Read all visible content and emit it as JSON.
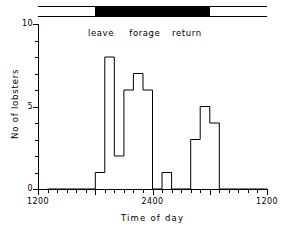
{
  "figure": {
    "background": "#ffffff",
    "ink": "#000000"
  },
  "daylight_bar": {
    "name": "light-dark-cycle-bar",
    "light_color": "#ffffff",
    "dark_color": "#000000",
    "segments": [
      {
        "label": "light",
        "start_hour": 12.0,
        "end_hour": 18.0,
        "color": "#ffffff"
      },
      {
        "label": "dark",
        "start_hour": 18.0,
        "end_hour": 30.0,
        "color": "#000000"
      },
      {
        "label": "light",
        "start_hour": 30.0,
        "end_hour": 36.0,
        "color": "#ffffff"
      }
    ]
  },
  "phase_labels": [
    {
      "text": "leave",
      "hour": 18.6
    },
    {
      "text": "forage",
      "hour": 23.2
    },
    {
      "text": "return",
      "hour": 27.6
    }
  ],
  "chart_data": {
    "type": "bar",
    "title": "",
    "subtitle": "",
    "xlabel": "Time of day",
    "ylabel": "No of lobsters",
    "xlim": [
      12,
      36
    ],
    "ylim": [
      0,
      10
    ],
    "grid": false,
    "legend": null,
    "bar_width_hours": 1,
    "x_tick_labels": [
      {
        "hour": 12,
        "label": "1200"
      },
      {
        "hour": 24,
        "label": "2400"
      },
      {
        "hour": 36,
        "label": "1200"
      }
    ],
    "x_major_ticks_hours": [
      12,
      18,
      24,
      30,
      36
    ],
    "x_minor_tick_step_hours": 1,
    "y_tick_labels": [
      {
        "value": 0,
        "label": "0"
      },
      {
        "value": 5,
        "label": "5"
      },
      {
        "value": 10,
        "label": "10"
      }
    ],
    "y_major_ticks": [
      0,
      5,
      10
    ],
    "y_minor_tick_step": 1,
    "categories": [
      "1200",
      "1300",
      "1400",
      "1500",
      "1600",
      "1700",
      "1800",
      "1900",
      "2000",
      "2100",
      "2200",
      "2300",
      "2400",
      "0100",
      "0200",
      "0300",
      "0400",
      "0500",
      "0600",
      "0700",
      "0800",
      "0900",
      "1000",
      "1100"
    ],
    "bin_start_hours": [
      12,
      13,
      14,
      15,
      16,
      17,
      18,
      19,
      20,
      21,
      22,
      23,
      24,
      25,
      26,
      27,
      28,
      29,
      30,
      31,
      32,
      33,
      34,
      35
    ],
    "values": [
      0,
      0,
      0,
      0,
      0,
      0,
      1,
      8,
      2,
      6,
      7,
      6,
      0,
      1,
      0,
      0,
      3,
      5,
      4,
      0,
      0,
      0,
      0,
      0
    ]
  }
}
